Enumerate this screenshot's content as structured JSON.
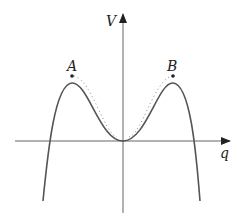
{
  "diagram": {
    "axes": {
      "x_label": "q",
      "y_label": "V"
    },
    "points": [
      {
        "id": "A",
        "label": "A",
        "description": "left maximum point"
      },
      {
        "id": "B",
        "label": "B",
        "description": "right maximum point"
      }
    ],
    "curves": [
      {
        "id": "solid",
        "style": "solid",
        "description": "double-hump potential with minimum at origin"
      },
      {
        "id": "dotted",
        "style": "dotted",
        "description": "modified curve slightly above solid between the maxima"
      }
    ],
    "colors": {
      "curve": "#555555",
      "axis": "#666666",
      "dotted": "#888888",
      "text": "#222222"
    }
  }
}
